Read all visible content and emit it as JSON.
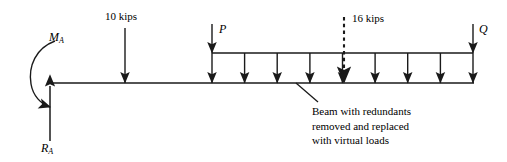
{
  "figure": {
    "type": "structural-beam-free-body-diagram",
    "background_color": "#ffffff",
    "line_color": "#1a1a1a",
    "width": 507,
    "height": 162
  },
  "labels": {
    "point_load_10": "10 kips",
    "point_load_16": "16 kips",
    "virtual_load_p": "P",
    "virtual_load_q": "Q",
    "moment_reaction": "M",
    "moment_reaction_sub": "A",
    "force_reaction": "R",
    "force_reaction_sub": "A"
  },
  "annotation": {
    "line1": "Beam with redundants",
    "line2": "removed and replaced",
    "line3": "with virtual loads"
  },
  "beam": {
    "x_start": 50,
    "x_end": 474,
    "y": 83
  },
  "supports": {
    "fixed_end_x": 50,
    "reaction_arrow_tail_y": 141,
    "reaction_arrow_head_y": 80,
    "moment_arc_label_x": 50,
    "moment_arc_label_y": 36
  },
  "applied_loads": [
    {
      "name": "10 kips",
      "x": 125,
      "tail_y": 28,
      "head_y": 83,
      "style": "solid"
    },
    {
      "name": "16 kips",
      "x": 344,
      "tail_y": 17,
      "head_y": 83,
      "style": "dashed"
    }
  ],
  "virtual_loads": [
    {
      "name": "P",
      "x": 212,
      "tail_y": 24,
      "head_y": 53,
      "label_x": 219,
      "label_y": 25
    },
    {
      "name": "Q",
      "x": 473,
      "tail_y": 24,
      "head_y": 53,
      "label_x": 480,
      "label_y": 25
    }
  ],
  "distributed_load": {
    "top_line_y": 53,
    "x_start": 212,
    "x_end": 473,
    "arrow_count": 9,
    "arrow_x_positions": [
      212,
      244.6,
      277.2,
      309.9,
      342.5,
      375.1,
      407.7,
      440.4,
      473
    ],
    "arrow_head_y": 83
  },
  "leader_line": {
    "x1": 296,
    "y1": 83,
    "x2": 318,
    "y2": 102
  },
  "annotation_position": {
    "x": 312,
    "y": 104
  }
}
